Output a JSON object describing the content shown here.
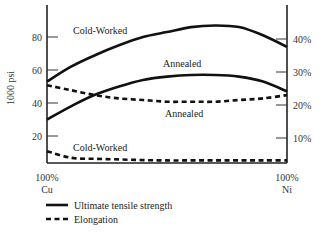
{
  "chart_data": {
    "type": "line",
    "title": "",
    "xlabel": "",
    "x_tick_labels": [
      {
        "line1": "100%",
        "line2": "Cu"
      },
      {
        "line1": "100%",
        "line2": "Ni"
      }
    ],
    "x": [
      0,
      10,
      20,
      30,
      40,
      50,
      60,
      70,
      80,
      90,
      100
    ],
    "x_unit": "% Ni",
    "ylabel_left": "1000 psi",
    "ylim_left": [
      0,
      100
    ],
    "yticks_left": [
      20,
      40,
      60,
      80
    ],
    "ylabel_right": "",
    "ylim_right": [
      0,
      50
    ],
    "yticks_right": [
      "10%",
      "20%",
      "30%",
      "40%"
    ],
    "yticks_right_values": [
      10,
      20,
      30,
      40
    ],
    "grid": false,
    "series": [
      {
        "name": "Cold-Worked",
        "measure": "Ultimate tensile strength",
        "axis": "left",
        "style": "solid",
        "values": [
          53,
          62,
          69,
          75,
          80,
          83,
          86,
          87,
          86,
          81,
          74
        ]
      },
      {
        "name": "Annealed",
        "measure": "Ultimate tensile strength",
        "axis": "left",
        "style": "solid",
        "values": [
          30,
          38,
          45,
          50,
          54,
          56,
          57,
          57,
          56,
          53,
          47
        ]
      },
      {
        "name": "Annealed",
        "measure": "Elongation",
        "axis": "right",
        "style": "dashed",
        "values": [
          26,
          24.5,
          23,
          22,
          21.5,
          21,
          21,
          21,
          21.5,
          22,
          23
        ]
      },
      {
        "name": "Cold-Worked",
        "measure": "Elongation",
        "axis": "right",
        "style": "dashed",
        "values": [
          6,
          4,
          3.7,
          3.5,
          3.3,
          3.2,
          3.2,
          3.2,
          3.2,
          3.2,
          3.2
        ]
      }
    ],
    "annotations": [
      {
        "text": "Cold-Worked",
        "x": 73,
        "y": 34
      },
      {
        "text": "Annealed",
        "x": 163,
        "y": 67
      },
      {
        "text": "Annealed",
        "x": 165,
        "y": 117
      },
      {
        "text": "Cold-Worked",
        "x": 73,
        "y": 151
      }
    ],
    "legend": {
      "position": "bottom-left",
      "entries": [
        {
          "label": "Ultimate tensile strength",
          "style": "solid"
        },
        {
          "label": "Elongation",
          "style": "dashed"
        }
      ]
    }
  }
}
